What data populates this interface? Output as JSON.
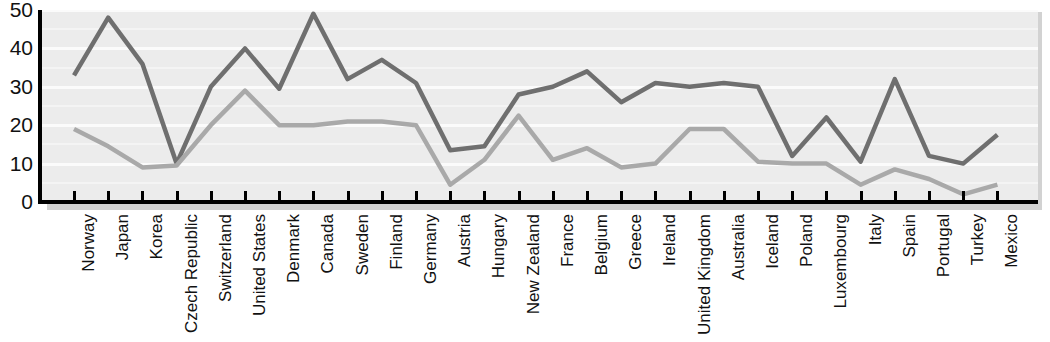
{
  "chart_data": {
    "type": "line",
    "title": "",
    "subtitle": "",
    "xlabel": "",
    "ylabel": "",
    "ylim": [
      0,
      50
    ],
    "yticks": [
      0,
      10,
      20,
      30,
      40,
      50
    ],
    "grid": true,
    "legend": "none",
    "categories": [
      "Norway",
      "Japan",
      "Korea",
      "Czech Republic",
      "Switzerland",
      "United States",
      "Denmark",
      "Canada",
      "Sweden",
      "Finland",
      "Germany",
      "Austria",
      "Hungary",
      "New Zealand",
      "France",
      "Belgium",
      "Greece",
      "Ireland",
      "United Kingdom",
      "Australia",
      "Iceland",
      "Poland",
      "Luxembourg",
      "Italy",
      "Spain",
      "Portugal",
      "Turkey",
      "Mexico"
    ],
    "series": [
      {
        "name": "upper-series",
        "color": "#6f6f6f",
        "values": [
          33,
          48,
          36,
          10,
          30,
          40,
          29.5,
          49,
          32,
          37,
          31,
          13.5,
          14.5,
          28,
          30,
          34,
          26,
          31,
          30,
          31,
          30,
          12,
          22,
          10.5,
          32,
          12,
          10,
          17.5
        ]
      },
      {
        "name": "lower-series",
        "color": "#a9a9a9",
        "values": [
          19,
          14.5,
          9,
          9.5,
          20,
          29,
          20,
          20,
          21,
          21,
          20,
          4.5,
          11,
          22.5,
          11,
          14,
          9,
          10,
          19,
          19,
          10.5,
          10,
          10,
          4.5,
          8.5,
          6,
          2,
          4.5
        ]
      }
    ],
    "colors": {
      "plot_background": "#ececec",
      "gridline": "#fbfbfb",
      "axis": "#000000",
      "shadow": "#d2d2d2"
    }
  }
}
